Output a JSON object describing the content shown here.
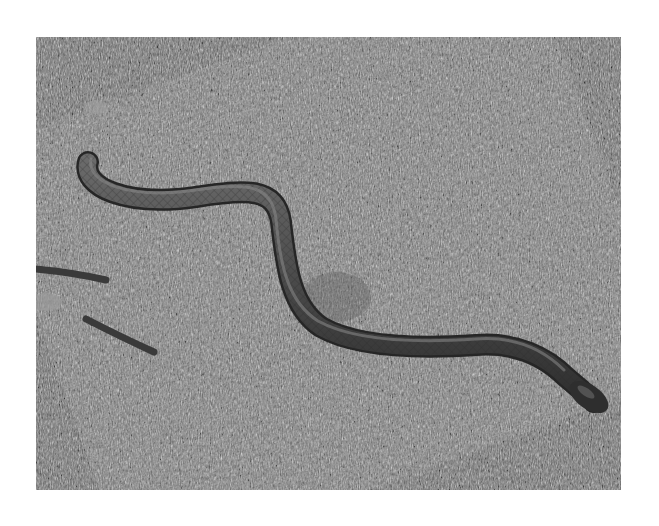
{
  "image": {
    "description": "Black-and-white photograph of a snake slithering across dry grass",
    "subject": "snake",
    "background": "grass",
    "color_mode": "grayscale",
    "frame": {
      "x": 36,
      "y": 37,
      "width": 585,
      "height": 453
    },
    "colors": {
      "page_background": "#ffffff",
      "grass_dark": "#3a3a3a",
      "grass_mid": "#7a7a7a",
      "grass_light": "#c8c8c8",
      "snake_body": "#4a4a4a",
      "snake_edge": "#2a2a2a",
      "snake_highlight": "#8a8a8a"
    }
  }
}
